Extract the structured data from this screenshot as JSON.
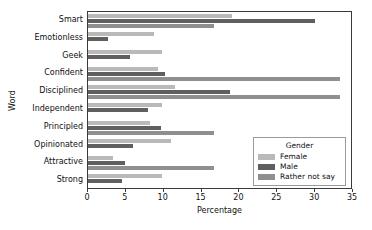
{
  "chart_data": {
    "type": "bar",
    "orientation": "horizontal",
    "title": "",
    "xlabel": "Percentage",
    "ylabel": "Word",
    "xlim": [
      0,
      35
    ],
    "xticks": [
      0,
      5,
      10,
      15,
      20,
      25,
      30,
      35
    ],
    "grid": false,
    "categories": [
      "Smart",
      "Emotionless",
      "Geek",
      "Confident",
      "Disciplined",
      "Independent",
      "Principled",
      "Opinionated",
      "Attractive",
      "Strong"
    ],
    "series": [
      {
        "name": "Female",
        "color": "#b9b9b9",
        "values": [
          19.0,
          8.7,
          9.8,
          9.3,
          11.5,
          9.8,
          8.2,
          10.9,
          3.3,
          9.8
        ]
      },
      {
        "name": "Male",
        "color": "#5f5f5f",
        "values": [
          30.0,
          2.7,
          5.6,
          10.2,
          18.8,
          7.9,
          9.7,
          5.9,
          4.9,
          4.5
        ]
      },
      {
        "name": "Rather not say",
        "color": "#8f8f8f",
        "values": [
          16.7,
          0,
          0,
          33.3,
          33.3,
          0,
          16.7,
          0,
          16.7,
          0
        ]
      }
    ],
    "legend": {
      "title": "Gender",
      "position": "lower right",
      "entries": [
        "Female",
        "Male",
        "Rather not say"
      ]
    }
  }
}
